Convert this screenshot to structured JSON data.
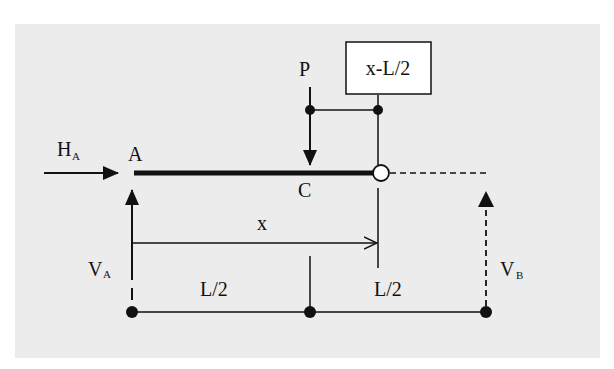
{
  "diagram": {
    "type": "beam free-body diagram",
    "labels": {
      "horizontal_reaction": "H",
      "horizontal_reaction_sub": "A",
      "support_a": "A",
      "load": "P",
      "load_point": "C",
      "distance_box": "x-L/2",
      "distance_x": "x",
      "vertical_reaction_a": "V",
      "vertical_reaction_a_sub": "A",
      "vertical_reaction_b": "V",
      "vertical_reaction_b_sub": "B",
      "half_span_left": "L/2",
      "half_span_right": "L/2"
    },
    "colors": {
      "panel": "#ececec",
      "ink": "#111111",
      "hinge_fill": "#ffffff"
    }
  }
}
